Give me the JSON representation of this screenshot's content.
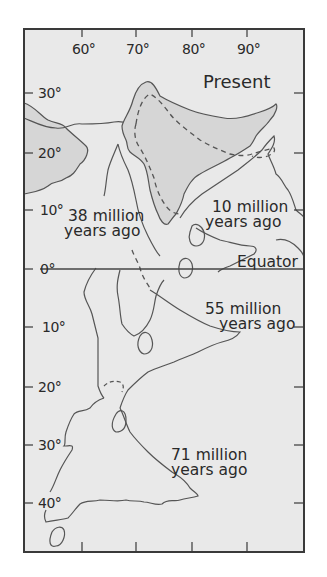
{
  "map": {
    "title": "Drift of India",
    "colors": {
      "sea": "#e9e9e9",
      "present_land": "#d6d6d6",
      "frame": "#3a3a3a",
      "coastline": "#555555",
      "text": "#2a2a2a"
    },
    "longitude_ticks": [
      {
        "label": "60°",
        "x": 82
      },
      {
        "label": "70°",
        "x": 136
      },
      {
        "label": "80°",
        "x": 192
      },
      {
        "label": "90°",
        "x": 247
      }
    ],
    "latitude_ticks": [
      {
        "label": "30°",
        "y": 93
      },
      {
        "label": "20°",
        "y": 153
      },
      {
        "label": "10°",
        "y": 210
      },
      {
        "label": "0°",
        "y": 269
      },
      {
        "label": "10°",
        "y": 327
      },
      {
        "label": "20°",
        "y": 387
      },
      {
        "label": "30°",
        "y": 445
      },
      {
        "label": "40°",
        "y": 503
      }
    ],
    "equator_label": "Equator",
    "positions": [
      {
        "label_line1": "Present",
        "label_line2": ""
      },
      {
        "label_line1": "10 million",
        "label_line2": "years ago"
      },
      {
        "label_line1": "38 million",
        "label_line2": "years ago"
      },
      {
        "label_line1": "55 million",
        "label_line2": "years ago"
      },
      {
        "label_line1": "71 million",
        "label_line2": "years ago"
      }
    ]
  }
}
